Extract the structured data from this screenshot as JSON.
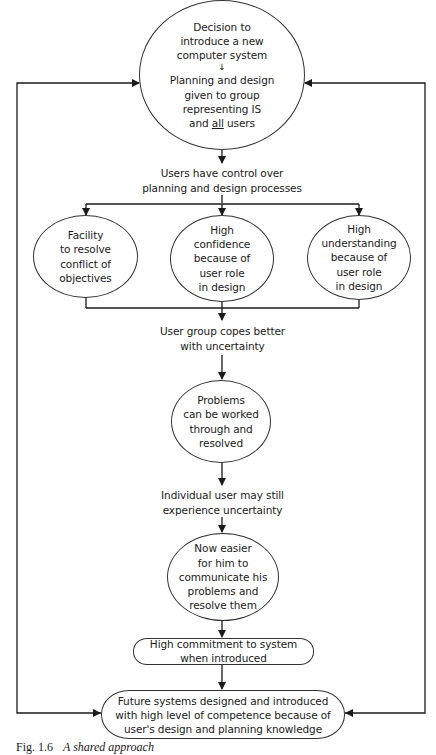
{
  "diagram": {
    "type": "flowchart",
    "colors": {
      "line": "#1a1a1a",
      "background": "#ffffff"
    },
    "nodes": {
      "start": {
        "shape": "ellipse",
        "line1": "Decision to\nintroduce a new\ncomputer system",
        "inner_arrow": "↓",
        "line2_prefix": "Planning and design\ngiven to group\nrepresenting IS\nand ",
        "line2_underlined": "all",
        "line2_suffix": " users"
      },
      "users_control": {
        "shape": "text",
        "text": "Users have control over\nplanning and design processes"
      },
      "facility": {
        "shape": "ellipse",
        "text": "Facility\nto resolve\nconflict of\nobjectives"
      },
      "high_confidence": {
        "shape": "ellipse",
        "text": "High\nconfidence\nbecause of\nuser role\nin design"
      },
      "high_understanding": {
        "shape": "ellipse",
        "text": "High\nunderstanding\nbecause of\nuser role\nin design"
      },
      "group_copes": {
        "shape": "text",
        "text": "User group copes better\nwith uncertainty"
      },
      "problems": {
        "shape": "ellipse",
        "text": "Problems\ncan be worked\nthrough and\nresolved"
      },
      "individual": {
        "shape": "text",
        "text": "Individual user may still\nexperience uncertainty"
      },
      "now_easier": {
        "shape": "ellipse",
        "text": "Now easier\nfor him to\ncommunicate his\nproblems and\nresolve them"
      },
      "commitment": {
        "shape": "rounded-box",
        "text": "High commitment to system\nwhen introduced"
      },
      "future": {
        "shape": "rounded-box",
        "text": "Future systems designed and introduced\nwith high level of competence because of\nuser's design and planning knowledge"
      }
    },
    "edges": [
      [
        "start",
        "users_control"
      ],
      [
        "users_control",
        "facility"
      ],
      [
        "users_control",
        "high_confidence"
      ],
      [
        "users_control",
        "high_understanding"
      ],
      [
        "facility",
        "group_copes"
      ],
      [
        "high_confidence",
        "group_copes"
      ],
      [
        "high_understanding",
        "group_copes"
      ],
      [
        "group_copes",
        "problems"
      ],
      [
        "problems",
        "individual"
      ],
      [
        "individual",
        "now_easier"
      ],
      [
        "now_easier",
        "commitment"
      ],
      [
        "commitment",
        "future"
      ],
      [
        "future",
        "start",
        "feedback-left"
      ],
      [
        "future",
        "start",
        "feedback-right"
      ]
    ],
    "caption": {
      "number": "Fig. 1.6",
      "title": "A shared approach"
    }
  }
}
